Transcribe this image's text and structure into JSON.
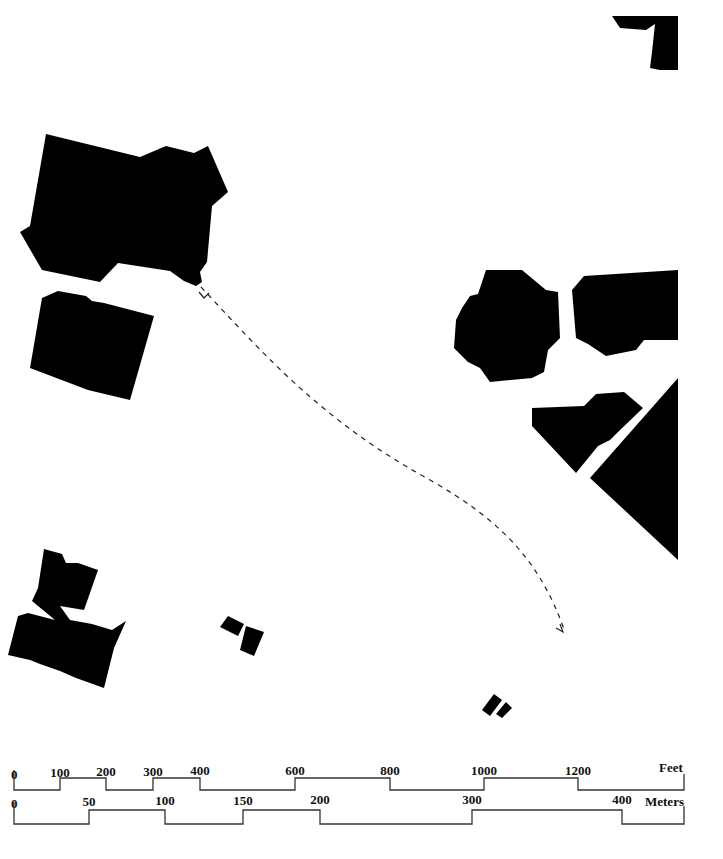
{
  "map": {
    "type": "figure-ground site plan",
    "colors": {
      "building": "#000000",
      "background": "#ffffff",
      "path": "#222222"
    },
    "buildings": [
      {
        "id": "top-right-corner",
        "points": "612,16 678,16 678,70 660,70 650,68 652,52 655,24 646,30 620,28"
      },
      {
        "id": "large-northwest-complex",
        "points": "46,134 140,157 166,146 194,153 208,146 228,192 212,206 207,262 200,272 202,282 196,286 184,281 170,271 118,263 100,282 42,270 20,232 30,226"
      },
      {
        "id": "west-block",
        "points": "58,291 86,296 92,301 104,303 154,316 130,400 88,390 30,368 42,298"
      },
      {
        "id": "octagon-building",
        "points": "486,270 522,270 546,290 558,292 560,338 548,350 544,372 532,378 490,382 480,368 468,362 454,348 456,320 462,308 470,296 478,294"
      },
      {
        "id": "east-block",
        "points": "584,276 678,270 678,340 644,340 636,350 606,356 588,344 576,338 572,290"
      },
      {
        "id": "trapezoid-block",
        "points": "532,408 584,406 596,394 624,392 643,408 618,432 610,440 598,446 576,473 532,426"
      },
      {
        "id": "triangle-block",
        "points": "678,378 678,560 590,478"
      },
      {
        "id": "southwest-complex",
        "points": "44,549 62,554 66,563 78,563 98,570 84,610 60,606 70,620 92,624 112,630 126,621 114,648 104,688 76,678 60,671 40,664 30,660 8,655 18,616 28,613 55,620 32,601 38,588"
      },
      {
        "id": "small-shed-a",
        "points": "220,627 228,616 244,624 238,636"
      },
      {
        "id": "small-shed-b",
        "points": "240,650 246,626 264,632 254,656"
      },
      {
        "id": "tiny-shed-a",
        "points": "482,710 494,694 502,700 490,716"
      },
      {
        "id": "tiny-shed-b",
        "points": "496,714 506,702 512,708 502,718"
      }
    ],
    "dashed_route": {
      "d": "M201,287 C260,350 320,420 430,480 C500,520 540,560 565,632",
      "start_arrow": "M199,292 L204,298 L209,293",
      "end_arrow": "M556,628 L563,632 L560,624"
    }
  },
  "scale_bars": {
    "feet": {
      "unit_label": "Feet",
      "ticks": [
        "0",
        "100",
        "200",
        "300",
        "400",
        "600",
        "800",
        "1000",
        "1200"
      ],
      "tick_x": [
        14,
        60,
        106,
        153,
        200,
        295,
        390,
        484,
        578
      ],
      "end_x": 684
    },
    "meters": {
      "unit_label": "Meters",
      "ticks": [
        "0",
        "50",
        "100",
        "150",
        "200",
        "300",
        "400"
      ],
      "tick_x": [
        14,
        89,
        165,
        243,
        320,
        472,
        622
      ],
      "end_x": 684
    }
  }
}
